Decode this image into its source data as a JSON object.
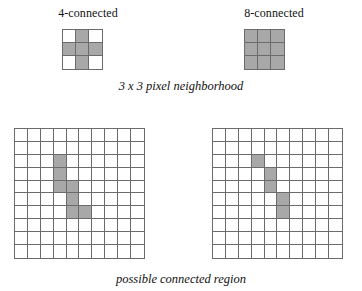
{
  "figure": {
    "headings": {
      "four_connected": "4-connected",
      "eight_connected": "8-connected"
    },
    "captions": {
      "neighborhood": "3 x 3 pixel neighborhood",
      "region": "possible connected region"
    },
    "colors": {
      "filled_cell": "#a8a8a8",
      "empty_cell": "#ffffff",
      "grid_line": "#6b6b6b",
      "text": "#111111",
      "background": "#ffffff"
    }
  },
  "chart_data": {
    "type": "heatmap",
    "xlabel": "",
    "ylabel": "",
    "grid": true,
    "legend": "none",
    "panels": [
      {
        "name": "four-connected-neighborhood",
        "label": "4-connected",
        "rows": 3,
        "cols": 3,
        "filled_cells": [
          [
            0,
            1
          ],
          [
            1,
            0
          ],
          [
            1,
            1
          ],
          [
            1,
            2
          ],
          [
            2,
            1
          ]
        ],
        "matrix": [
          [
            0,
            1,
            0
          ],
          [
            1,
            1,
            1
          ],
          [
            0,
            1,
            0
          ]
        ]
      },
      {
        "name": "eight-connected-neighborhood",
        "label": "8-connected",
        "rows": 3,
        "cols": 3,
        "filled_cells": [
          [
            0,
            0
          ],
          [
            0,
            1
          ],
          [
            0,
            2
          ],
          [
            1,
            0
          ],
          [
            1,
            1
          ],
          [
            1,
            2
          ],
          [
            2,
            0
          ],
          [
            2,
            1
          ],
          [
            2,
            2
          ]
        ],
        "matrix": [
          [
            1,
            1,
            1
          ],
          [
            1,
            1,
            1
          ],
          [
            1,
            1,
            1
          ]
        ]
      },
      {
        "name": "four-connected-region",
        "label": "possible connected region (4-connected)",
        "rows": 10,
        "cols": 10,
        "filled_cells": [
          [
            2,
            3
          ],
          [
            3,
            3
          ],
          [
            4,
            3
          ],
          [
            4,
            4
          ],
          [
            5,
            4
          ],
          [
            6,
            4
          ],
          [
            6,
            5
          ]
        ],
        "matrix": [
          [
            0,
            0,
            0,
            0,
            0,
            0,
            0,
            0,
            0,
            0
          ],
          [
            0,
            0,
            0,
            0,
            0,
            0,
            0,
            0,
            0,
            0
          ],
          [
            0,
            0,
            0,
            1,
            0,
            0,
            0,
            0,
            0,
            0
          ],
          [
            0,
            0,
            0,
            1,
            0,
            0,
            0,
            0,
            0,
            0
          ],
          [
            0,
            0,
            0,
            1,
            1,
            0,
            0,
            0,
            0,
            0
          ],
          [
            0,
            0,
            0,
            0,
            1,
            0,
            0,
            0,
            0,
            0
          ],
          [
            0,
            0,
            0,
            0,
            1,
            1,
            0,
            0,
            0,
            0
          ],
          [
            0,
            0,
            0,
            0,
            0,
            0,
            0,
            0,
            0,
            0
          ],
          [
            0,
            0,
            0,
            0,
            0,
            0,
            0,
            0,
            0,
            0
          ],
          [
            0,
            0,
            0,
            0,
            0,
            0,
            0,
            0,
            0,
            0
          ]
        ]
      },
      {
        "name": "eight-connected-region",
        "label": "possible connected region (8-connected)",
        "rows": 10,
        "cols": 10,
        "filled_cells": [
          [
            2,
            3
          ],
          [
            3,
            4
          ],
          [
            4,
            4
          ],
          [
            5,
            5
          ],
          [
            6,
            5
          ]
        ],
        "matrix": [
          [
            0,
            0,
            0,
            0,
            0,
            0,
            0,
            0,
            0,
            0
          ],
          [
            0,
            0,
            0,
            0,
            0,
            0,
            0,
            0,
            0,
            0
          ],
          [
            0,
            0,
            0,
            1,
            0,
            0,
            0,
            0,
            0,
            0
          ],
          [
            0,
            0,
            0,
            0,
            1,
            0,
            0,
            0,
            0,
            0
          ],
          [
            0,
            0,
            0,
            0,
            1,
            0,
            0,
            0,
            0,
            0
          ],
          [
            0,
            0,
            0,
            0,
            0,
            1,
            0,
            0,
            0,
            0
          ],
          [
            0,
            0,
            0,
            0,
            0,
            1,
            0,
            0,
            0,
            0
          ],
          [
            0,
            0,
            0,
            0,
            0,
            0,
            0,
            0,
            0,
            0
          ],
          [
            0,
            0,
            0,
            0,
            0,
            0,
            0,
            0,
            0,
            0
          ],
          [
            0,
            0,
            0,
            0,
            0,
            0,
            0,
            0,
            0,
            0
          ]
        ]
      }
    ]
  }
}
